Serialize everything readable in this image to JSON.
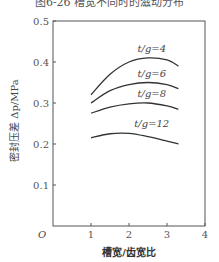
{
  "caption": "图6-26  槽宽不同时的滋动分布",
  "chart_data": {
    "type": "line",
    "title": "图6-26  槽宽不同时的滋动分布",
    "xlabel": "槽宽/齿宽比",
    "ylabel": "密封压差 Δp/MPa",
    "xlim": [
      0,
      4
    ],
    "ylim": [
      0,
      0.5
    ],
    "origin_label": "O",
    "x_ticks": [
      "1",
      "2",
      "3",
      "4"
    ],
    "y_ticks": [
      "0.1",
      "0.2",
      "0.3",
      "0.4",
      "0.5"
    ],
    "grid": false,
    "legend": "inline labels above curves",
    "series": [
      {
        "name": "t/g=4",
        "x": [
          1.0,
          1.5,
          2.0,
          2.5,
          3.0,
          3.3
        ],
        "y": [
          0.32,
          0.37,
          0.4,
          0.41,
          0.405,
          0.39
        ]
      },
      {
        "name": "t/g=6",
        "x": [
          1.0,
          1.5,
          2.0,
          2.5,
          3.0,
          3.3
        ],
        "y": [
          0.3,
          0.33,
          0.345,
          0.35,
          0.345,
          0.335
        ]
      },
      {
        "name": "t/g=8",
        "x": [
          1.0,
          1.5,
          2.0,
          2.5,
          3.0,
          3.3
        ],
        "y": [
          0.275,
          0.29,
          0.298,
          0.3,
          0.293,
          0.285
        ]
      },
      {
        "name": "t/g=12",
        "x": [
          1.0,
          1.5,
          2.0,
          2.5,
          3.0,
          3.3
        ],
        "y": [
          0.215,
          0.225,
          0.226,
          0.218,
          0.207,
          0.2
        ]
      }
    ]
  }
}
